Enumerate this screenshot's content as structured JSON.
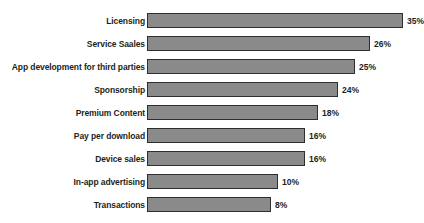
{
  "chart_data": {
    "type": "bar",
    "orientation": "horizontal",
    "title": "",
    "subtitle": "",
    "xlabel": "",
    "ylabel": "",
    "grid": false,
    "legend": null,
    "axis_visible": false,
    "value_suffix": "%",
    "xlim": [
      0,
      35
    ],
    "categories": [
      "Licensing",
      "Service Saales",
      "App development for third parties",
      "Sponsorship",
      "Premium Content",
      "Pay per download",
      "Device sales",
      "In-app advertising",
      "Transactions"
    ],
    "values": [
      35,
      26,
      25,
      24,
      18,
      16,
      16,
      10,
      8
    ],
    "value_labels": [
      "35%",
      "26%",
      "25%",
      "24%",
      "18%",
      "16%",
      "16%",
      "10%",
      "8%"
    ],
    "bar_pixel_widths": [
      256,
      223,
      208,
      191,
      171,
      158,
      158,
      131,
      124
    ],
    "bars": [
      {
        "category": "Licensing",
        "value": 35,
        "label": "35%",
        "width_px": 256
      },
      {
        "category": "Service Saales",
        "value": 26,
        "label": "26%",
        "width_px": 223
      },
      {
        "category": "App development for third parties",
        "value": 25,
        "label": "25%",
        "width_px": 208
      },
      {
        "category": "Sponsorship",
        "value": 24,
        "label": "24%",
        "width_px": 191
      },
      {
        "category": "Premium Content",
        "value": 18,
        "label": "18%",
        "width_px": 171
      },
      {
        "category": "Pay per download",
        "value": 16,
        "label": "16%",
        "width_px": 158
      },
      {
        "category": "Device sales",
        "value": 16,
        "label": "16%",
        "width_px": 158
      },
      {
        "category": "In-app advertising",
        "value": 10,
        "label": "10%",
        "width_px": 131
      },
      {
        "category": "Transactions",
        "value": 8,
        "label": "8%",
        "width_px": 124
      }
    ],
    "colors": {
      "bar_fill": "#8a8a8a",
      "bar_border": "#2e2e2e",
      "text": "#231f20",
      "background": "#ffffff"
    },
    "layout": {
      "row_pitch_px": 23,
      "first_row_top_px": 12,
      "bar_height_px": 15,
      "bar_left_px": 147
    }
  }
}
